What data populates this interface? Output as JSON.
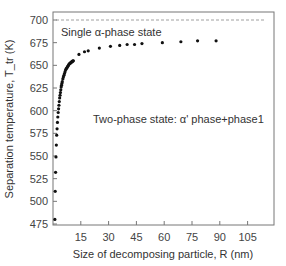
{
  "chart_data": {
    "type": "scatter",
    "title": "",
    "xlabel": "Size of decomposing particle, R (nm)",
    "ylabel": "Separation temperature, T_tr (K)",
    "xlim": [
      0,
      120
    ],
    "ylim": [
      475,
      705
    ],
    "xticks": [
      15,
      30,
      45,
      60,
      75,
      90,
      105
    ],
    "yticks": [
      475,
      500,
      525,
      550,
      575,
      600,
      625,
      650,
      675,
      700
    ],
    "grid": false,
    "reference_line": {
      "y": 700,
      "style": "dashed",
      "label": "Single α-phase state"
    },
    "annotations": [
      {
        "text": "Single α-phase state",
        "x": 2,
        "y": 688
      },
      {
        "text": "Two-phase state: α' phase+phase1",
        "x": 21,
        "y": 608
      }
    ],
    "series": [
      {
        "name": "T_tr vs R",
        "marker": "circle",
        "color": "#111111",
        "x": [
          1.0,
          1.2,
          1.4,
          1.6,
          1.8,
          2.0,
          2.2,
          2.4,
          2.6,
          2.8,
          3.0,
          3.2,
          3.4,
          3.6,
          3.8,
          4.0,
          4.2,
          4.4,
          4.6,
          4.8,
          5.0,
          5.3,
          5.6,
          5.9,
          6.2,
          6.5,
          6.8,
          7.1,
          7.4,
          7.7,
          8.0,
          8.3,
          8.6,
          8.9,
          9.2,
          9.5,
          9.8,
          10.1,
          10.4,
          10.7,
          11.0,
          14,
          17,
          19,
          25,
          31,
          36,
          40,
          44,
          48,
          59,
          69,
          78,
          88
        ],
        "y": [
          480,
          511,
          532,
          549,
          562,
          573,
          580,
          587,
          593,
          598,
          602,
          606,
          610,
          614,
          617,
          620,
          623,
          626,
          628,
          630,
          632,
          635,
          637,
          639,
          641,
          643,
          645,
          646,
          647,
          648,
          649,
          650,
          651,
          652,
          652,
          653,
          653,
          654,
          654,
          655,
          655,
          662,
          665,
          666,
          669,
          671,
          672,
          673,
          673,
          674,
          675,
          676,
          677,
          677
        ]
      }
    ]
  }
}
